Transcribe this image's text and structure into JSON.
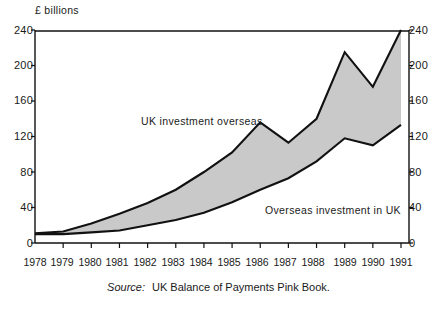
{
  "figure": {
    "unit_caption": "£ billions",
    "source_word": "Source:",
    "source_text": "UK Balance of Payments Pink Book."
  },
  "chart_data": {
    "type": "area",
    "title": "",
    "subtitle": "",
    "xlabel": "",
    "ylabel": "£ billions",
    "ylim": [
      0,
      240
    ],
    "yticks": [
      0,
      40,
      80,
      120,
      160,
      200,
      240
    ],
    "ytick_labels_left": [
      "240",
      "200",
      "160",
      "120",
      "80",
      "40",
      "0"
    ],
    "ytick_labels_right": [
      "240",
      "200",
      "160",
      "120",
      "80",
      "40",
      "0"
    ],
    "grid": false,
    "legend_position": "inline-annotation",
    "categories": [
      "1978",
      "1979",
      "1980",
      "1981",
      "1982",
      "1983",
      "1984",
      "1985",
      "1986",
      "1987",
      "1988",
      "1989",
      "1990",
      "1991"
    ],
    "x": [
      1978,
      1979,
      1980,
      1981,
      1982,
      1983,
      1984,
      1985,
      1986,
      1987,
      1988,
      1989,
      1990,
      1991
    ],
    "series": [
      {
        "name": "UK investment overseas",
        "label": "UK investment overseas",
        "values": [
          11,
          13,
          22,
          33,
          45,
          60,
          80,
          102,
          136,
          113,
          140,
          215,
          176,
          240
        ]
      },
      {
        "name": "Overseas investment in UK",
        "label": "Overseas investment in UK",
        "values": [
          10,
          10,
          12,
          14,
          20,
          26,
          34,
          46,
          60,
          73,
          92,
          118,
          110,
          133
        ]
      }
    ],
    "band_fill": "#c9c9c9",
    "line_color": "#111111",
    "axis_color": "#111111",
    "background": "#ffffff"
  }
}
